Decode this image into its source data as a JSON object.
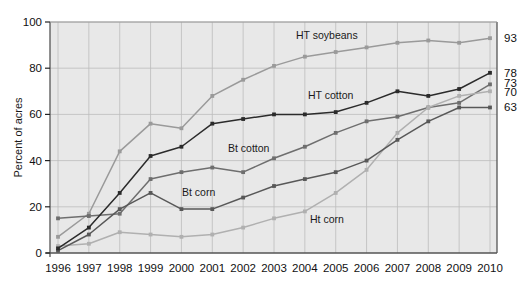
{
  "chart_data": {
    "type": "line",
    "title": "",
    "xlabel": "",
    "ylabel": "Percent of acres",
    "ylim": [
      0,
      100
    ],
    "yticks": [
      0,
      20,
      40,
      60,
      80,
      100
    ],
    "ytick_labels": [
      "0",
      "20",
      "40",
      "60",
      "80",
      "100"
    ],
    "grid": true,
    "legend_position": "inline-annotations",
    "x": [
      1996,
      1997,
      1998,
      1999,
      2000,
      2001,
      2002,
      2003,
      2004,
      2005,
      2006,
      2007,
      2008,
      2009,
      2010
    ],
    "xtick_labels": [
      "1996",
      "1997",
      "1998",
      "1999",
      "2000",
      "2001",
      "2002",
      "2003",
      "2004",
      "2005",
      "2006",
      "2007",
      "2008",
      "2009",
      "2010"
    ],
    "series": [
      {
        "name": "HT soybeans",
        "color": "#9a9a9a",
        "label": "HT soybeans",
        "end_value": 93,
        "values": [
          7,
          17,
          44,
          56,
          54,
          68,
          75,
          81,
          85,
          87,
          89,
          91,
          92,
          91,
          93
        ]
      },
      {
        "name": "HT cotton",
        "color": "#2b2b2b",
        "label": "HT cotton",
        "end_value": 78,
        "values": [
          2,
          11,
          26,
          42,
          46,
          56,
          58,
          60,
          60,
          61,
          65,
          70,
          68,
          71,
          78
        ]
      },
      {
        "name": "Bt cotton",
        "color": "#6e6e6e",
        "label": "Bt cotton",
        "end_value": 73,
        "values": [
          15,
          16,
          17,
          32,
          35,
          37,
          35,
          41,
          46,
          52,
          57,
          59,
          63,
          65,
          73
        ]
      },
      {
        "name": "Ht corn",
        "color": "#b0b0b0",
        "label": "Ht corn",
        "end_value": 70,
        "values": [
          3,
          4,
          9,
          8,
          7,
          8,
          11,
          15,
          18,
          26,
          36,
          52,
          63,
          68,
          70
        ]
      },
      {
        "name": "Bt corn",
        "color": "#585858",
        "label": "Bt corn",
        "end_value": 63,
        "values": [
          1,
          8,
          19,
          26,
          19,
          19,
          24,
          29,
          32,
          35,
          40,
          49,
          57,
          63,
          63
        ]
      }
    ],
    "end_labels": [
      {
        "value": "93",
        "series": "HT soybeans"
      },
      {
        "value": "78",
        "series": "HT cotton"
      },
      {
        "value": "73",
        "series": "Bt cotton"
      },
      {
        "value": "70",
        "series": "Ht corn"
      },
      {
        "value": "63",
        "series": "Bt corn"
      }
    ],
    "annotations": [
      {
        "text": "HT soybeans",
        "series": "HT soybeans"
      },
      {
        "text": "HT cotton",
        "series": "HT cotton"
      },
      {
        "text": "Bt cotton",
        "series": "Bt cotton"
      },
      {
        "text": "Bt corn",
        "series": "Bt corn"
      },
      {
        "text": "Ht corn",
        "series": "Ht corn"
      }
    ],
    "plot_background": "#e8e8e8",
    "grid_color": "#bdbdbd",
    "axis_color": "#555555"
  }
}
